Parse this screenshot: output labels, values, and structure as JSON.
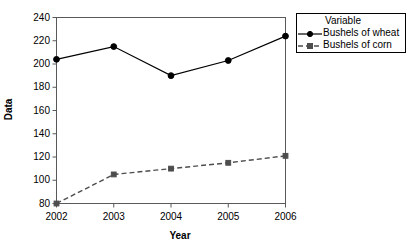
{
  "chart_data": {
    "type": "line",
    "title": "",
    "xlabel": "Year",
    "ylabel": "Data",
    "categories": [
      "2002",
      "2003",
      "2004",
      "2005",
      "2006"
    ],
    "x": [
      2002,
      2003,
      2004,
      2005,
      2006
    ],
    "xlim": [
      2002,
      2006
    ],
    "ylim": [
      80,
      240
    ],
    "yticks": [
      80,
      100,
      120,
      140,
      160,
      180,
      200,
      220,
      240
    ],
    "ytick_labels": [
      "80",
      "100",
      "120",
      "140",
      "160",
      "180",
      "200",
      "220",
      "240"
    ],
    "xticks": [
      2002,
      2003,
      2004,
      2005,
      2006
    ],
    "xtick_labels": [
      "2002",
      "2003",
      "2004",
      "2005",
      "2006"
    ],
    "grid": false,
    "legend_position": "top-right-outside",
    "legend_title": "Variable",
    "series": [
      {
        "name": "Bushels of wheat",
        "values": [
          204,
          215,
          190,
          203,
          224
        ],
        "color": "#000000",
        "line_style": "solid",
        "marker": "circle"
      },
      {
        "name": "Bushels of corn",
        "values": [
          80,
          105,
          110,
          115,
          121
        ],
        "color": "#4d4d4d",
        "line_style": "dashed",
        "marker": "square"
      }
    ]
  },
  "legend": {
    "title": "Variable",
    "entries": [
      {
        "label": "Bushels of wheat"
      },
      {
        "label": "Bushels of corn"
      }
    ]
  },
  "axes": {
    "x_title": "Year",
    "y_title": "Data"
  },
  "colors": {
    "background": "#ffffff",
    "axis": "#595959",
    "series_wheat": "#000000",
    "series_corn": "#4d4d4d"
  }
}
